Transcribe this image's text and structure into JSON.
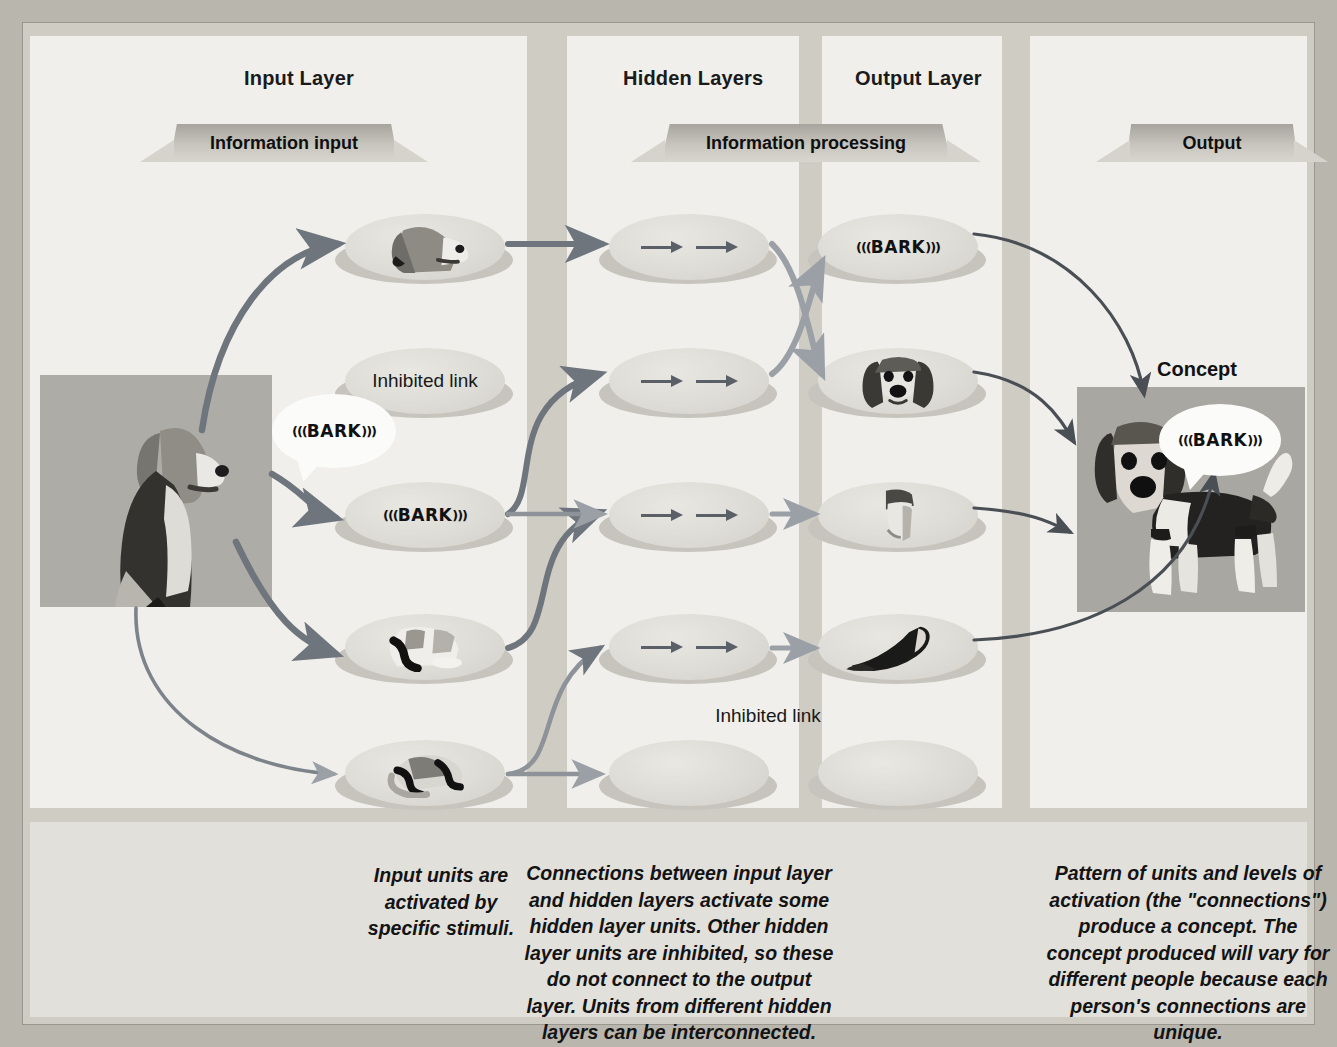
{
  "figure": {
    "topic": "Connectionist / parallel distributed processing network model of a concept",
    "layer_titles": {
      "input": "Input Layer",
      "hidden": "Hidden Layers",
      "output": "Output Layer"
    },
    "ribbons": {
      "input": "Information input",
      "hidden": "Information processing",
      "output": "Output"
    },
    "concept_label": "Concept"
  },
  "colors": {
    "page_background": "#b9b6ae",
    "frame": "#cfccc4",
    "column": "#f0efeb",
    "caption_band": "#e2e0da",
    "node_fill": "#dedcd6",
    "node_shadow": "#c6c4bd",
    "ribbon_dark": "#a6a49d",
    "ribbon_light": "#d8d6cf",
    "arrow_strong": "#6e757d",
    "arrow_light": "#9aa0a6",
    "arrow_thin": "#4a4f55",
    "text": "#131313",
    "photo_background": "#a9a7a1"
  },
  "input_stimulus": {
    "name": "whole-dog-photo",
    "bark_bubble": "((( BARK )))"
  },
  "input_layer": {
    "nodes": [
      {
        "id": "in-head",
        "kind": "photo",
        "content": "dog-head",
        "label": ""
      },
      {
        "id": "in-inhibited",
        "kind": "text",
        "content": "",
        "label": "Inhibited link"
      },
      {
        "id": "in-bark",
        "kind": "bark",
        "content": "((( BARK )))",
        "label": "((( BARK )))"
      },
      {
        "id": "in-paws",
        "kind": "photo",
        "content": "dog-front-paws",
        "label": ""
      },
      {
        "id": "in-hindleg",
        "kind": "photo",
        "content": "dog-hind-leg",
        "label": ""
      }
    ]
  },
  "hidden_layer": {
    "nodes": [
      {
        "id": "hid-1",
        "kind": "arrows",
        "label": "→ →",
        "active": true
      },
      {
        "id": "hid-2",
        "kind": "arrows",
        "label": "→ →",
        "active": true
      },
      {
        "id": "hid-3",
        "kind": "arrows",
        "label": "→ →",
        "active": true
      },
      {
        "id": "hid-4",
        "kind": "arrows",
        "label": "→ →",
        "active": true
      },
      {
        "id": "hid-5",
        "kind": "empty",
        "label": "",
        "active": false
      }
    ],
    "inhibited_note": "Inhibited link"
  },
  "output_layer": {
    "nodes": [
      {
        "id": "out-bark",
        "kind": "bark",
        "content": "((( BARK )))",
        "label": "((( BARK )))"
      },
      {
        "id": "out-head",
        "kind": "photo",
        "content": "dog-head-front",
        "label": ""
      },
      {
        "id": "out-paw",
        "kind": "photo",
        "content": "dog-paw",
        "label": ""
      },
      {
        "id": "out-tail",
        "kind": "photo",
        "content": "dog-tail",
        "label": ""
      },
      {
        "id": "out-empty",
        "kind": "empty",
        "content": "",
        "label": ""
      }
    ]
  },
  "concept": {
    "title": "Concept",
    "photo": "standing-beagle-photo",
    "bark_bubble": "((( BARK )))"
  },
  "captions": {
    "input": "Input units are activated by specific stimuli.",
    "hidden": "Connections between input layer and hidden layers activate some hidden layer units. Other hidden layer units are inhibited, so these do not connect to the output layer. Units from different hidden layers can be interconnected.",
    "output": "Pattern of units and levels of activation (the \"connections\") produce a concept. The concept produced will vary for different people because each person's connections are unique."
  }
}
